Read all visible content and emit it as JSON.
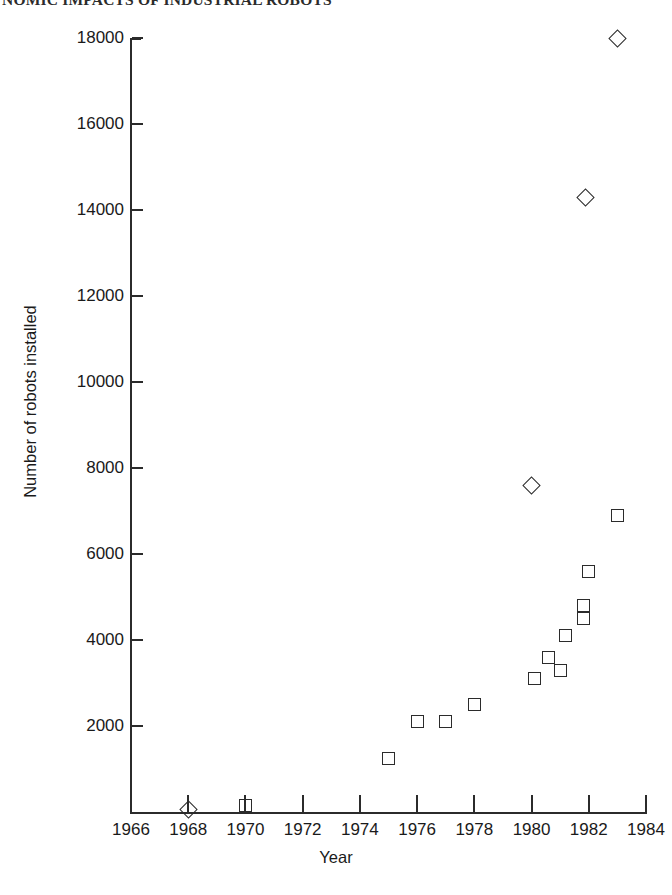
{
  "page": {
    "running_head": "NOMIC IMPACTS OF INDUSTRIAL ROBOTS"
  },
  "chart_data": {
    "type": "scatter",
    "title": "",
    "xlabel": "Year",
    "ylabel": "Number of robots installed",
    "xlim": [
      1966,
      1984
    ],
    "ylim": [
      0,
      18000
    ],
    "xticks": [
      1966,
      1968,
      1970,
      1972,
      1974,
      1976,
      1978,
      1980,
      1982,
      1984
    ],
    "xtick_labels": [
      "1966",
      "1968",
      "1970",
      "1972",
      "1974",
      "1976",
      "1978",
      "1980",
      "1982",
      "1984"
    ],
    "yticks": [
      2000,
      4000,
      6000,
      8000,
      10000,
      12000,
      14000,
      16000,
      18000
    ],
    "ytick_labels": [
      "2000",
      "4000",
      "6000",
      "8000",
      "10000",
      "12000",
      "14000",
      "16000",
      "18000"
    ],
    "grid": false,
    "legend": "none",
    "series": [
      {
        "name": "square-series",
        "marker": "square",
        "points": [
          {
            "x": 1970.0,
            "y": 150
          },
          {
            "x": 1975.0,
            "y": 1250
          },
          {
            "x": 1976.0,
            "y": 2100
          },
          {
            "x": 1977.0,
            "y": 2100
          },
          {
            "x": 1978.0,
            "y": 2500
          },
          {
            "x": 1980.1,
            "y": 3100
          },
          {
            "x": 1980.6,
            "y": 3600
          },
          {
            "x": 1981.0,
            "y": 3300
          },
          {
            "x": 1981.2,
            "y": 4100
          },
          {
            "x": 1981.8,
            "y": 4800
          },
          {
            "x": 1981.8,
            "y": 4500
          },
          {
            "x": 1982.0,
            "y": 5600
          },
          {
            "x": 1983.0,
            "y": 6900
          }
        ]
      },
      {
        "name": "diamond-series",
        "marker": "diamond",
        "points": [
          {
            "x": 1968.0,
            "y": 60
          },
          {
            "x": 1980.0,
            "y": 7600
          },
          {
            "x": 1981.9,
            "y": 14300
          },
          {
            "x": 1983.0,
            "y": 18000
          }
        ]
      }
    ]
  }
}
